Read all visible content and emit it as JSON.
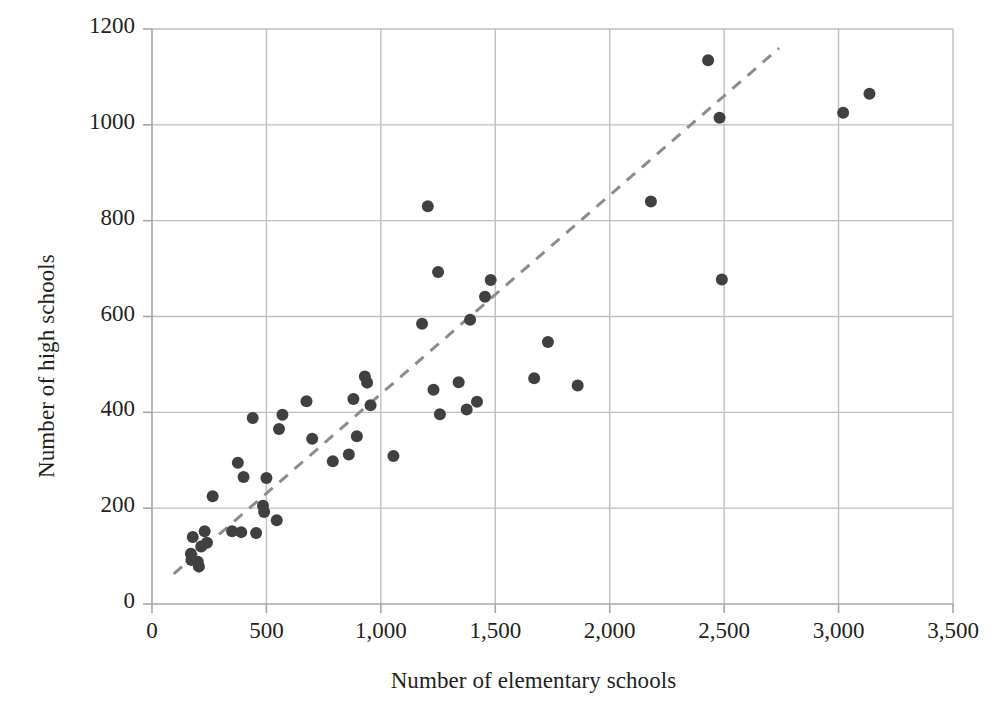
{
  "chart_data": {
    "type": "scatter",
    "title": "",
    "xlabel": "Number of elementary schools",
    "ylabel": "Number of high schools",
    "xlim": [
      0,
      3500
    ],
    "ylim": [
      0,
      1200
    ],
    "xticks": [
      0,
      500,
      1000,
      1500,
      2000,
      2500,
      3000,
      3500
    ],
    "xtick_labels": [
      "0",
      "500",
      "1,000",
      "1,500",
      "2,000",
      "2,500",
      "3,000",
      "3,500"
    ],
    "yticks": [
      0,
      200,
      400,
      600,
      800,
      1000,
      1200
    ],
    "ytick_labels": [
      "0",
      "200",
      "400",
      "600",
      "800",
      "1000",
      "1200"
    ],
    "grid": true,
    "grid_color": "#bfbfbf",
    "legend": "none",
    "marker_color": "#404040",
    "marker_size": 11,
    "points": [
      [
        170,
        105
      ],
      [
        172,
        92
      ],
      [
        178,
        140
      ],
      [
        200,
        88
      ],
      [
        205,
        78
      ],
      [
        215,
        120
      ],
      [
        230,
        152
      ],
      [
        240,
        128
      ],
      [
        265,
        225
      ],
      [
        350,
        152
      ],
      [
        375,
        295
      ],
      [
        390,
        150
      ],
      [
        400,
        265
      ],
      [
        440,
        388
      ],
      [
        455,
        148
      ],
      [
        485,
        205
      ],
      [
        490,
        192
      ],
      [
        500,
        263
      ],
      [
        545,
        175
      ],
      [
        555,
        365
      ],
      [
        570,
        395
      ],
      [
        675,
        423
      ],
      [
        700,
        345
      ],
      [
        790,
        298
      ],
      [
        860,
        312
      ],
      [
        880,
        428
      ],
      [
        895,
        350
      ],
      [
        930,
        475
      ],
      [
        940,
        462
      ],
      [
        955,
        415
      ],
      [
        1055,
        309
      ],
      [
        1180,
        585
      ],
      [
        1205,
        830
      ],
      [
        1230,
        447
      ],
      [
        1250,
        693
      ],
      [
        1258,
        396
      ],
      [
        1340,
        463
      ],
      [
        1375,
        406
      ],
      [
        1390,
        593
      ],
      [
        1420,
        422
      ],
      [
        1455,
        641
      ],
      [
        1480,
        676
      ],
      [
        1670,
        471
      ],
      [
        1730,
        547
      ],
      [
        1860,
        456
      ],
      [
        2180,
        840
      ],
      [
        2430,
        1135
      ],
      [
        2480,
        1015
      ],
      [
        2490,
        677
      ],
      [
        3020,
        1025
      ],
      [
        3135,
        1065
      ]
    ],
    "trendline": {
      "style": "dashed",
      "color": "#8c8c8c",
      "x0": 95,
      "y0": 63,
      "x1": 2740,
      "y1": 1160
    }
  }
}
